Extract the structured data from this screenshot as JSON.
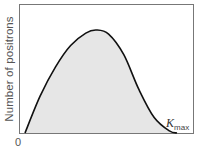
{
  "chart_data": {
    "type": "area",
    "title": "",
    "xlabel": "",
    "ylabel": "Number of positrons",
    "x_origin_label": "0",
    "annotations": [
      {
        "text": "K_max",
        "base": "K",
        "subscript": "max",
        "position": "end of curve on x-axis"
      }
    ],
    "x": [
      0,
      0.1,
      0.2,
      0.3,
      0.4,
      0.47,
      0.55,
      0.65,
      0.75,
      0.85,
      0.95,
      1.0
    ],
    "values": [
      0,
      0.36,
      0.64,
      0.85,
      0.97,
      1.0,
      0.96,
      0.76,
      0.42,
      0.15,
      0.02,
      0
    ],
    "xlim": [
      0,
      1
    ],
    "ylim": [
      0,
      1.25
    ],
    "grid": false,
    "fill_color": "#e6e6e6",
    "line_color": "#111111",
    "frame_color": "#777777"
  },
  "labels": {
    "ylabel": "Number of positrons",
    "origin": "0",
    "kmax_base": "K",
    "kmax_sub": "max"
  }
}
